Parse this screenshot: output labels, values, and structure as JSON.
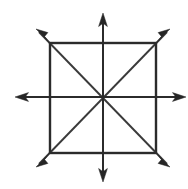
{
  "figure": {
    "title": "Square with diagonals and medians, eight arrowed rays",
    "background_color": "#ffffff",
    "line_color": "#2b2b2b",
    "diagonal_color": "#3a3a3a",
    "arrow_color": "#262626",
    "canvas": {
      "width": 188,
      "height": 189
    },
    "center": {
      "x": 103,
      "y": 98
    },
    "square": {
      "name": "square",
      "left": 50,
      "top": 43,
      "right": 156,
      "bottom": 153,
      "width": 106,
      "height": 110,
      "stroke_width": 2.4
    },
    "rays": [
      {
        "name": "ray-up",
        "direction": "up",
        "angle_deg": 90,
        "tip": {
          "x": 103,
          "y": 13
        },
        "start": {
          "x": 103,
          "y": 98
        }
      },
      {
        "name": "ray-down",
        "direction": "down",
        "angle_deg": 270,
        "tip": {
          "x": 103,
          "y": 182
        },
        "start": {
          "x": 103,
          "y": 98
        }
      },
      {
        "name": "ray-left",
        "direction": "left",
        "angle_deg": 180,
        "tip": {
          "x": 15,
          "y": 97
        },
        "start": {
          "x": 103,
          "y": 97
        }
      },
      {
        "name": "ray-right",
        "direction": "right",
        "angle_deg": 0,
        "tip": {
          "x": 186,
          "y": 97
        },
        "start": {
          "x": 103,
          "y": 97
        }
      },
      {
        "name": "ray-up-left",
        "direction": "up-left",
        "angle_deg": 135,
        "tip": {
          "x": 36,
          "y": 29
        },
        "start": {
          "x": 103,
          "y": 98
        }
      },
      {
        "name": "ray-up-right",
        "direction": "up-right",
        "angle_deg": 45,
        "tip": {
          "x": 170,
          "y": 29
        },
        "start": {
          "x": 103,
          "y": 98
        }
      },
      {
        "name": "ray-down-left",
        "direction": "down-left",
        "angle_deg": 225,
        "tip": {
          "x": 36,
          "y": 167
        },
        "start": {
          "x": 103,
          "y": 98
        }
      },
      {
        "name": "ray-down-right",
        "direction": "down-right",
        "angle_deg": 315,
        "tip": {
          "x": 170,
          "y": 167
        },
        "start": {
          "x": 103,
          "y": 98
        }
      }
    ],
    "arrowhead": {
      "length": 13,
      "half_width": 4.5
    },
    "counts": {
      "rays": 8,
      "arrowheads": 8,
      "diagonals": 2,
      "medians": 2,
      "square_edges": 4
    }
  }
}
